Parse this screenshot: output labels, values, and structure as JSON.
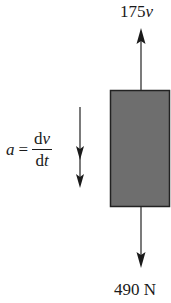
{
  "diagram": {
    "type": "free-body-diagram",
    "body": {
      "shape": "rectangle",
      "fill_color": "#6e6e6e",
      "border_color": "#222222"
    },
    "forces": [
      {
        "name": "drag-force",
        "direction": "up",
        "label_value": "175",
        "label_var": "v"
      },
      {
        "name": "weight-force",
        "direction": "down",
        "label": "490 N"
      }
    ],
    "acceleration": {
      "direction": "down",
      "lhs": "a",
      "equals": "=",
      "numerator_d": "d",
      "numerator_var": "v",
      "denominator_d": "d",
      "denominator_var": "t"
    },
    "colors": {
      "line": "#333333",
      "text": "#1a1a1a"
    }
  }
}
